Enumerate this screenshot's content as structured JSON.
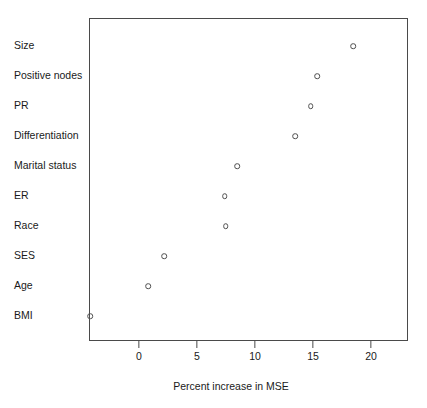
{
  "chart_data": {
    "type": "scatter",
    "title": "",
    "subtitle": "",
    "xlabel": "Percent increase in MSE",
    "ylabel": "",
    "categories": [
      "Size",
      "Positive nodes",
      "PR",
      "Differentiation",
      "Marital status",
      "ER",
      "Race",
      "SES",
      "Age",
      "BMI"
    ],
    "values": [
      18.4,
      15.3,
      14.7,
      13.4,
      8.4,
      7.3,
      7.4,
      2.1,
      0.7,
      -4.3
    ],
    "points": [
      {
        "label": "Size",
        "value": 18.4
      },
      {
        "label": "Positive nodes",
        "value": 15.3
      },
      {
        "label": "PR",
        "value": 14.7
      },
      {
        "label": "Differentiation",
        "value": 13.4
      },
      {
        "label": "Marital status",
        "value": 8.4
      },
      {
        "label": "ER",
        "value": 7.3
      },
      {
        "label": "Race",
        "value": 7.4
      },
      {
        "label": "SES",
        "value": 2.1
      },
      {
        "label": "Age",
        "value": 0.7
      },
      {
        "label": "BMI",
        "value": -4.3
      }
    ],
    "xticks": [
      0,
      5,
      10,
      15,
      20
    ],
    "xtick_labels": [
      "0",
      "5",
      "10",
      "15",
      "20"
    ],
    "xlim": [
      -4.3,
      23.2
    ],
    "grid": false,
    "legend": null,
    "marker": "open-circle",
    "marker_color": "#4f4f4f",
    "frame_color": "#4a4a4a",
    "text_color": "#1a1a1a",
    "background": "#ffffff"
  }
}
